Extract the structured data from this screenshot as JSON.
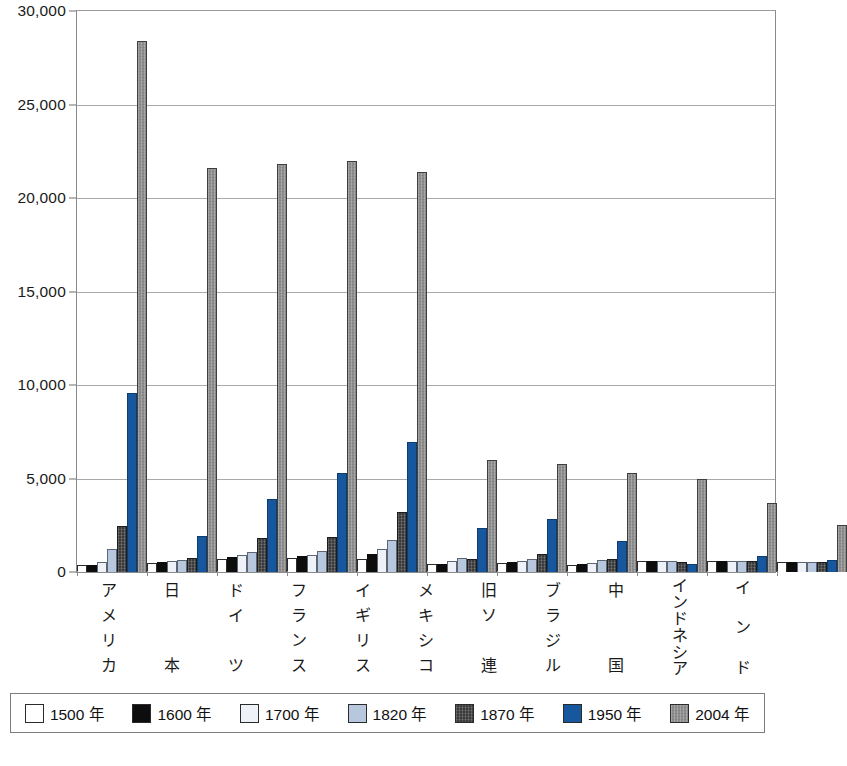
{
  "chart_data": {
    "type": "bar",
    "title": "",
    "subtitle": "",
    "xlabel": "",
    "ylabel": "",
    "ylim": [
      0,
      30000
    ],
    "grid": true,
    "legend_position": "bottom",
    "y_ticks": [
      "0",
      "5,000",
      "10,000",
      "15,000",
      "20,000",
      "25,000",
      "30,000"
    ],
    "y_tick_values": [
      0,
      5000,
      10000,
      15000,
      20000,
      25000,
      30000
    ],
    "categories": [
      "アメリカ",
      "日本",
      "ドイツ",
      "フランス",
      "イギリス",
      "メキシコ",
      "旧ソ連",
      "ブラジル",
      "中国",
      "インドネシア",
      "インド"
    ],
    "category_chars": [
      [
        "ア",
        "メ",
        "リ",
        "カ"
      ],
      [
        "日",
        "",
        "",
        "本"
      ],
      [
        "ド",
        "イ",
        "",
        "ツ"
      ],
      [
        "フ",
        "ラ",
        "ン",
        "ス"
      ],
      [
        "イ",
        "ギ",
        "リ",
        "ス"
      ],
      [
        "メ",
        "キ",
        "シ",
        "コ"
      ],
      [
        "旧",
        "ソ",
        "",
        "連"
      ],
      [
        "ブ",
        "ラ",
        "ジ",
        "ル"
      ],
      [
        "中",
        "",
        "",
        "国"
      ],
      [
        "イ",
        "ン",
        "ド",
        "ネ",
        "シ",
        "ア"
      ],
      [
        "イ",
        "",
        "ン",
        "",
        "ド"
      ]
    ],
    "series": [
      {
        "name": "1500 年",
        "color": "#ffffff",
        "values": [
          400,
          500,
          680,
          727,
          714,
          425,
          500,
          400,
          600,
          565,
          550
        ]
      },
      {
        "name": "1600 年",
        "color": "#0d0d0d",
        "values": [
          400,
          520,
          791,
          841,
          974,
          454,
          552,
          428,
          600,
          565,
          550
        ]
      },
      {
        "name": "1700 年",
        "color": "#eef2f8",
        "values": [
          527,
          570,
          910,
          910,
          1250,
          568,
          610,
          459,
          600,
          580,
          550
        ]
      },
      {
        "name": "1820 年",
        "color": "#b7c7de",
        "values": [
          1257,
          669,
          1077,
          1135,
          1706,
          759,
          689,
          646,
          600,
          612,
          533
        ]
      },
      {
        "name": "1870 年",
        "color": "#3b3b3b",
        "values": [
          2445,
          737,
          1839,
          1876,
          3190,
          674,
          943,
          713,
          530,
          578,
          533
        ]
      },
      {
        "name": "1950 年",
        "color": "#16579e",
        "values": [
          9561,
          1921,
          3881,
          5271,
          6939,
          2365,
          2841,
          1672,
          448,
          840,
          619
        ]
      },
      {
        "name": "2004 年",
        "color": "#8e8e8e",
        "values": [
          28400,
          21600,
          21800,
          22000,
          21400,
          6000,
          5800,
          5300,
          5000,
          3700,
          2500
        ]
      }
    ]
  },
  "legend": {
    "items": [
      {
        "label": "1500 年",
        "swatch_name": "legend-swatch-1500"
      },
      {
        "label": "1600 年",
        "swatch_name": "legend-swatch-1600"
      },
      {
        "label": "1700 年",
        "swatch_name": "legend-swatch-1700"
      },
      {
        "label": "1820 年",
        "swatch_name": "legend-swatch-1820"
      },
      {
        "label": "1870 年",
        "swatch_name": "legend-swatch-1870"
      },
      {
        "label": "1950 年",
        "swatch_name": "legend-swatch-1950"
      },
      {
        "label": "2004 年",
        "swatch_name": "legend-swatch-2004"
      }
    ]
  },
  "colors": {
    "grid": "#a9a9a9",
    "frame": "#8a8a8a",
    "text": "#1a1a1a",
    "accent_blue": "#16579e",
    "accent_gray": "#8e8e8e"
  }
}
